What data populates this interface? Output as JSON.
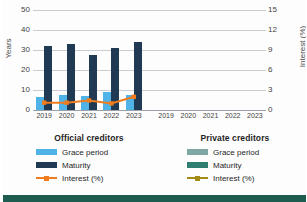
{
  "chart_data": {
    "type": "bar",
    "title": "",
    "ylabel": "Years",
    "y2label": "Interest (%)",
    "xlabel": "",
    "ylim": [
      0,
      50
    ],
    "y2lim": [
      0,
      15
    ],
    "yticks": [
      50,
      40,
      30,
      20,
      10,
      0
    ],
    "y2ticks": [
      15,
      12,
      9,
      6,
      3,
      0
    ],
    "grid": true,
    "legend_position": "bottom",
    "categories": [
      "2019",
      "2020",
      "2021",
      "2022",
      "2023"
    ],
    "panels": [
      {
        "name": "Official creditors",
        "series": [
          {
            "name": "Grace period",
            "axis": "left",
            "type": "bar",
            "values": [
              6,
              7,
              6.5,
              8,
              7
            ]
          },
          {
            "name": "Maturity",
            "axis": "left",
            "type": "bar",
            "values": [
              29,
              30,
              25,
              28,
              31
            ]
          },
          {
            "name": "Interest (%)",
            "axis": "right",
            "type": "line",
            "values": [
              1.0,
              1.0,
              1.3,
              0.9,
              1.8
            ]
          }
        ]
      },
      {
        "name": "Private creditors",
        "series": [
          {
            "name": "Grace period",
            "axis": "left",
            "type": "bar",
            "values": [
              null,
              null,
              null,
              null,
              null
            ]
          },
          {
            "name": "Maturity",
            "axis": "left",
            "type": "bar",
            "values": [
              null,
              null,
              null,
              null,
              null
            ]
          },
          {
            "name": "Interest (%)",
            "axis": "right",
            "type": "line",
            "values": [
              null,
              null,
              null,
              null,
              null
            ]
          }
        ]
      }
    ],
    "colors": {
      "official_grace": "#4FB3E8",
      "official_maturity": "#1F3A52",
      "official_interest": "#F07C1E",
      "private_grace": "#7FA8A4",
      "private_maturity": "#2E7F72",
      "private_interest": "#A38B18",
      "grid": "#C9CCD1",
      "footer": "#1D5C4F"
    }
  },
  "axes": {
    "left_label": "Years",
    "right_label": "Interest (%)",
    "left_ticks": [
      "50",
      "40",
      "30",
      "20",
      "10",
      "0"
    ],
    "right_ticks": [
      "15",
      "12",
      "9",
      "6",
      "3",
      "0"
    ]
  },
  "xaxis": {
    "official_years": [
      "2019",
      "2020",
      "2021",
      "2022",
      "2023"
    ],
    "private_years": [
      "2019",
      "2020",
      "2021",
      "2022",
      "2023"
    ]
  },
  "legends": {
    "official": {
      "title": "Official creditors",
      "items": [
        {
          "label": "Grace period",
          "kind": "swatch"
        },
        {
          "label": "Maturity",
          "kind": "swatch"
        },
        {
          "label": "Interest (%)",
          "kind": "line"
        }
      ]
    },
    "private": {
      "title": "Private creditors",
      "items": [
        {
          "label": "Grace period",
          "kind": "swatch"
        },
        {
          "label": "Maturity",
          "kind": "swatch"
        },
        {
          "label": "Interest (%)",
          "kind": "line"
        }
      ]
    }
  }
}
